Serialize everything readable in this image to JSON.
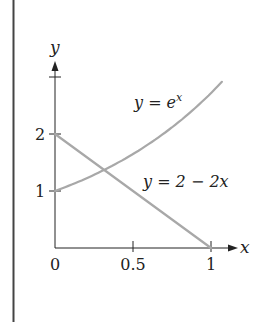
{
  "chart_data": {
    "type": "line",
    "title": "",
    "xlabel": "x",
    "ylabel": "y",
    "xlim": [
      0,
      1.1
    ],
    "ylim": [
      0,
      2.8
    ],
    "grid": false,
    "legend": "inline labels",
    "x_ticks": [
      {
        "value": 0,
        "label": "0"
      },
      {
        "value": 0.5,
        "label": "0.5"
      },
      {
        "value": 1,
        "label": "1"
      }
    ],
    "y_ticks": [
      {
        "value": 1,
        "label": "1"
      },
      {
        "value": 2,
        "label": "2"
      },
      {
        "value": 2.6,
        "label": ""
      }
    ],
    "series": [
      {
        "name": "y = e^x",
        "label_base": "y = e",
        "label_exp": "x",
        "x": [
          0,
          0.1,
          0.2,
          0.3,
          0.4,
          0.5,
          0.6,
          0.7,
          0.8,
          0.9,
          1.0,
          1.07
        ],
        "values": [
          1,
          1.105,
          1.221,
          1.35,
          1.492,
          1.649,
          1.822,
          2.014,
          2.226,
          2.46,
          2.718,
          2.92
        ],
        "color": "#a8a8a8"
      },
      {
        "name": "y = 2 − 2x",
        "label": "y = 2 − 2x",
        "x": [
          0,
          1
        ],
        "values": [
          2,
          0
        ],
        "color": "#a8a8a8"
      }
    ],
    "annotations": [
      {
        "text": "intersection",
        "x": 0.32,
        "y": 1.37
      }
    ]
  },
  "colors": {
    "axis": "#222222",
    "curve": "#a8a8a8",
    "border": "#444444"
  }
}
